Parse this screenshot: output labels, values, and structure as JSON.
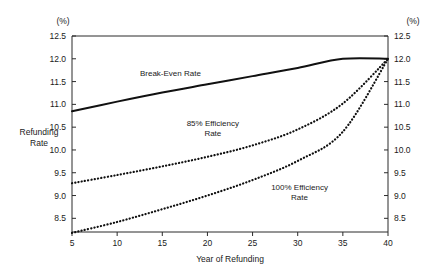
{
  "chart_data": {
    "type": "line",
    "title": "",
    "xlabel": "Year of Refunding",
    "ylabel": "Refunding Rate",
    "unit_label_left": "(%)",
    "unit_label_right": "(%)",
    "xlim": [
      5,
      40
    ],
    "ylim": [
      8.2,
      12.5
    ],
    "xticks": [
      5,
      10,
      15,
      20,
      25,
      30,
      35,
      40
    ],
    "xticklabels": [
      "5",
      "10",
      "15",
      "20",
      "25",
      "30",
      "35",
      "40"
    ],
    "yticks": [
      8.5,
      9.0,
      9.5,
      10.0,
      10.5,
      11.0,
      11.5,
      12.0,
      12.5
    ],
    "yticklabels": [
      "8.5",
      "9.0",
      "9.5",
      "10.0",
      "10.5",
      "11.0",
      "11.5",
      "12.0",
      "12.5"
    ],
    "right_yticks": [
      8.5,
      9.0,
      9.5,
      10.0,
      10.5,
      11.0,
      11.5,
      12.0,
      12.5
    ],
    "right_yticklabels": [
      "8.5",
      "9.0",
      "9.5",
      "10.0",
      "10.5",
      "11.0",
      "11.5",
      "12.0",
      "12.5"
    ],
    "grid": false,
    "legend_position": "inline-annotations",
    "x": [
      5,
      10,
      15,
      20,
      25,
      30,
      35,
      40
    ],
    "series": [
      {
        "name": "Break-Even Rate",
        "style": "solid",
        "color": "#111111",
        "values": [
          10.85,
          11.06,
          11.26,
          11.44,
          11.62,
          11.8,
          12.0,
          12.0
        ]
      },
      {
        "name": "85% Efficiency Rate",
        "style": "dotted",
        "color": "#111111",
        "values": [
          9.27,
          9.45,
          9.64,
          9.85,
          10.1,
          10.45,
          11.02,
          12.0
        ]
      },
      {
        "name": "100% Efficiency Rate",
        "style": "dotted",
        "color": "#111111",
        "values": [
          8.18,
          8.42,
          8.7,
          9.0,
          9.34,
          9.76,
          10.4,
          12.0
        ]
      }
    ],
    "annotations": [
      {
        "id": "break-even",
        "text": "Break-Even Rate",
        "x": 15.9,
        "y": 11.62
      },
      {
        "id": "eff85-line1",
        "text": "85% Efficiency",
        "x": 20.6,
        "y": 10.52
      },
      {
        "id": "eff85-line2",
        "text": "Rate",
        "x": 20.6,
        "y": 10.31
      },
      {
        "id": "eff100-line1",
        "text": "100% Efficiency",
        "x": 30.2,
        "y": 9.12
      },
      {
        "id": "eff100-line2",
        "text": "Rate",
        "x": 30.2,
        "y": 8.91
      }
    ]
  }
}
